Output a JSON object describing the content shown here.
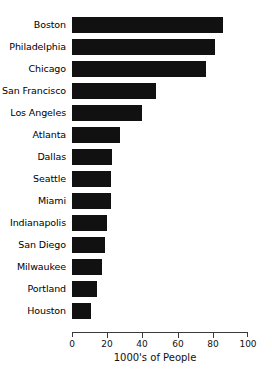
{
  "chart_data": {
    "type": "bar",
    "orientation": "horizontal",
    "title": "",
    "xlabel": "1000's of People",
    "ylabel": "",
    "xlim": [
      0,
      100
    ],
    "xticks": [
      0,
      20,
      40,
      60,
      80,
      100
    ],
    "grid": false,
    "legend": null,
    "bar_color": "#111111",
    "categories": [
      "Boston",
      "Philadelphia",
      "Chicago",
      "San Francisco",
      "Los Angeles",
      "Atlanta",
      "Dallas",
      "Seattle",
      "Miami",
      "Indianapolis",
      "San Diego",
      "Milwaukee",
      "Portland",
      "Houston"
    ],
    "values": [
      86,
      81,
      76,
      48,
      40,
      27,
      23,
      22,
      22,
      20,
      19,
      17,
      14,
      11
    ]
  },
  "axis": {
    "x_label": "1000's of People",
    "tick_labels": [
      "0",
      "20",
      "40",
      "60",
      "80",
      "100"
    ]
  },
  "header": {
    "cropped_title": ""
  }
}
